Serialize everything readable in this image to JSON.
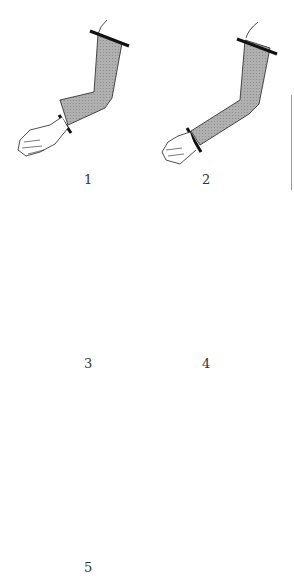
{
  "diagram": {
    "type": "figure",
    "colors": {
      "shade": "#a9a9a9",
      "outline": "#222222",
      "band": "#111111"
    },
    "figures": [
      {
        "label": "1",
        "coverage": "wrist to upper arm (shoulder)"
      },
      {
        "label": "2",
        "coverage": "wrist to upper arm (shoulder)"
      },
      {
        "label": "3",
        "coverage": "wrist to elbow"
      },
      {
        "label": "4",
        "coverage": "mid-forearm to elbow"
      },
      {
        "label": "5",
        "coverage": "hand to mid-forearm"
      }
    ]
  }
}
